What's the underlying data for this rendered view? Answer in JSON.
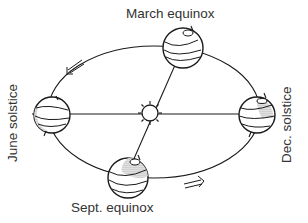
{
  "diagram": {
    "labels": {
      "march": "March equinox",
      "sept": "Sept. equinox",
      "june": "June solstice",
      "dec": "Dec. solstice"
    },
    "elements": {
      "sun": "sun-icon",
      "orbit": "elliptical-orbit",
      "direction_arrows": [
        "arrow-top-left",
        "arrow-bottom-right"
      ],
      "globes": [
        "march-earth",
        "june-earth",
        "dec-earth",
        "sept-earth"
      ]
    },
    "colors": {
      "stroke": "#1a1a1a",
      "text": "#333333",
      "shade": "#bdbdbd",
      "background": "#ffffff"
    }
  }
}
